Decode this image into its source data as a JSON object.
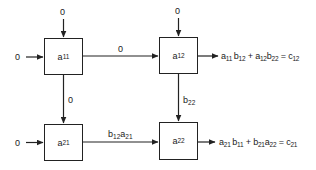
{
  "diagram": {
    "type": "systolic-array-2x2-matrix-multiply",
    "cells": [
      {
        "id": "a11",
        "base": "a",
        "sub": "11"
      },
      {
        "id": "a12",
        "base": "a",
        "sub": "12"
      },
      {
        "id": "a21",
        "base": "a",
        "sub": "21"
      },
      {
        "id": "a22",
        "base": "a",
        "sub": "22"
      }
    ],
    "inputs": {
      "top_a11": "0",
      "left_a11": "0",
      "top_a12": "0",
      "left_a21": "0"
    },
    "edges": {
      "a11_to_a12": "0",
      "a11_to_a21": "0",
      "a12_to_a22": {
        "base": "b",
        "sub": "22"
      },
      "a21_to_a22": [
        {
          "base": "b",
          "sub": "12"
        },
        {
          "base": "a",
          "sub": "21"
        }
      ]
    },
    "outputs": {
      "row1": {
        "terms": [
          {
            "base": "a",
            "sub": "11"
          },
          {
            "base": "b",
            "sub": "12"
          },
          {
            "op": "+"
          },
          {
            "base": "a",
            "sub": "12"
          },
          {
            "base": "b",
            "sub": "22"
          },
          {
            "op": "="
          },
          {
            "base": "c",
            "sub": "12"
          }
        ]
      },
      "row2": {
        "terms": [
          {
            "base": "a",
            "sub": "21"
          },
          {
            "base": "b",
            "sub": "11"
          },
          {
            "op": "+"
          },
          {
            "base": "b",
            "sub": "21"
          },
          {
            "base": "a",
            "sub": "22"
          },
          {
            "op": "="
          },
          {
            "base": "c",
            "sub": "21"
          }
        ]
      }
    },
    "colors": {
      "line": "#222222",
      "background": "#ffffff"
    }
  }
}
